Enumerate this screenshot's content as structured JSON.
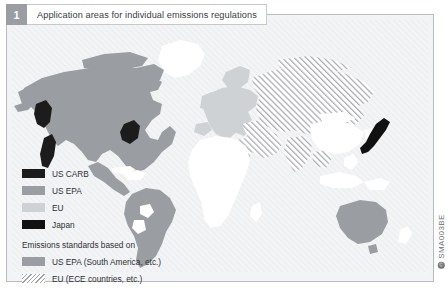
{
  "figure": {
    "number": "1",
    "title": "Application areas for individual emissions regulations",
    "source_code": "SMA003BE",
    "copyright_mark": "©"
  },
  "colors": {
    "us_carb": "#1c1c1c",
    "us_epa": "#9a9da1",
    "eu": "#cfd2d5",
    "japan": "#111111",
    "us_epa_south_america": "#9a9da1",
    "eu_ece_hatch_line": "#9ea1a5",
    "ocean": "#f3f4f5",
    "land_unregulated": "#ffffff",
    "frame": "#b9bcc0",
    "badge": "#9a9da1"
  },
  "legend": {
    "primary_items": [
      {
        "label": "US CARB",
        "swatch": "solid",
        "color_key": "us_carb",
        "name": "legend-us-carb"
      },
      {
        "label": "US EPA",
        "swatch": "solid",
        "color_key": "us_epa",
        "name": "legend-us-epa"
      },
      {
        "label": "EU",
        "swatch": "solid",
        "color_key": "eu",
        "name": "legend-eu"
      },
      {
        "label": "Japan",
        "swatch": "solid",
        "color_key": "japan",
        "name": "legend-japan"
      }
    ],
    "secondary_heading": "Emissions standards based on",
    "secondary_items": [
      {
        "label": "US EPA (South America, etc.)",
        "swatch": "solid",
        "color_key": "us_epa",
        "name": "legend-us-epa-south-america"
      },
      {
        "label": "EU (ECE countries, etc.)",
        "swatch": "hatch",
        "color_key": "eu_ece_hatch_line",
        "name": "legend-eu-ece"
      }
    ]
  },
  "map": {
    "regions": [
      {
        "name": "north-america",
        "fill": "us_epa"
      },
      {
        "name": "california",
        "fill": "us_carb"
      },
      {
        "name": "north-east-us-states",
        "fill": "us_carb"
      },
      {
        "name": "british-columbia",
        "fill": "us_carb"
      },
      {
        "name": "south-america",
        "fill": "us_epa"
      },
      {
        "name": "europe",
        "fill": "eu"
      },
      {
        "name": "russia-central-asia",
        "fill": "eu_ece_hatch"
      },
      {
        "name": "middle-east",
        "fill": "eu_ece_hatch"
      },
      {
        "name": "india",
        "fill": "eu_ece_hatch"
      },
      {
        "name": "japan",
        "fill": "japan"
      },
      {
        "name": "china",
        "fill": "land_unregulated"
      },
      {
        "name": "africa",
        "fill": "land_unregulated"
      },
      {
        "name": "australia",
        "fill": "us_epa"
      },
      {
        "name": "greenland",
        "fill": "land_unregulated"
      }
    ]
  }
}
